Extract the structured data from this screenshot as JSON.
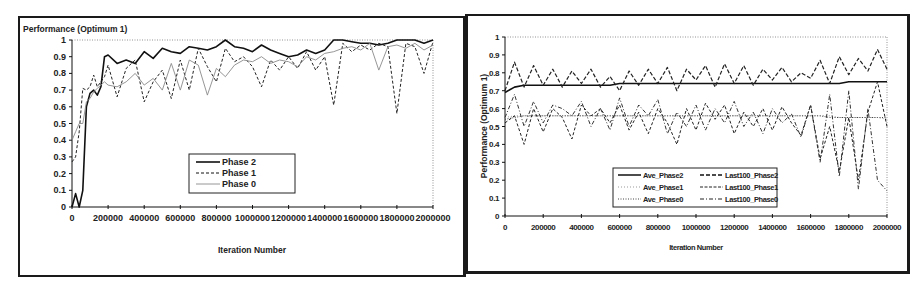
{
  "chart_data": [
    {
      "type": "line",
      "title": "Performance (Optimum 1)",
      "xlabel": "Iteration Number",
      "ylabel": "Performance (Optimum 1)",
      "xlim": [
        0,
        2000000
      ],
      "ylim": [
        0,
        1
      ],
      "x_ticks": [
        "0",
        "200000",
        "400000",
        "600000",
        "800000",
        "1000000",
        "1200000",
        "1400000",
        "1600000",
        "1800000",
        "2000000"
      ],
      "y_ticks": [
        "0",
        "0.1",
        "0.2",
        "0.3",
        "0.4",
        "0.5",
        "0.6",
        "0.7",
        "0.8",
        "0.9",
        "1"
      ],
      "grid": false,
      "legend_position": "center",
      "x": [
        0,
        20000,
        40000,
        60000,
        80000,
        100000,
        120000,
        140000,
        160000,
        180000,
        200000,
        250000,
        300000,
        350000,
        400000,
        450000,
        500000,
        550000,
        600000,
        650000,
        700000,
        750000,
        800000,
        850000,
        900000,
        950000,
        1000000,
        1050000,
        1100000,
        1150000,
        1200000,
        1250000,
        1300000,
        1350000,
        1400000,
        1450000,
        1500000,
        1550000,
        1600000,
        1650000,
        1700000,
        1750000,
        1800000,
        1850000,
        1900000,
        1950000,
        2000000
      ],
      "series": [
        {
          "name": "Phase 2",
          "style": "solid-bold",
          "values": [
            0.0,
            0.08,
            0.0,
            0.1,
            0.6,
            0.68,
            0.7,
            0.67,
            0.72,
            0.9,
            0.91,
            0.86,
            0.88,
            0.86,
            0.93,
            0.89,
            0.95,
            0.93,
            0.92,
            0.96,
            0.95,
            0.94,
            0.96,
            1.0,
            0.96,
            0.95,
            0.93,
            0.97,
            0.94,
            0.92,
            0.9,
            0.91,
            0.94,
            0.92,
            0.94,
            1.0,
            1.0,
            0.99,
            0.98,
            0.98,
            0.97,
            0.98,
            1.0,
            1.0,
            1.0,
            0.98,
            1.0
          ]
        },
        {
          "name": "Phase 1",
          "style": "dashed",
          "values": [
            0.27,
            0.3,
            0.45,
            0.71,
            0.7,
            0.72,
            0.79,
            0.72,
            0.75,
            0.78,
            0.85,
            0.66,
            0.83,
            0.88,
            0.63,
            0.75,
            0.82,
            0.65,
            0.88,
            0.7,
            0.95,
            0.84,
            0.75,
            0.95,
            0.87,
            0.9,
            0.84,
            0.72,
            0.88,
            0.82,
            0.9,
            0.83,
            0.93,
            0.82,
            0.9,
            0.61,
            0.98,
            0.93,
            0.97,
            0.94,
            0.98,
            0.96,
            0.56,
            0.98,
            0.96,
            0.8,
            0.99
          ]
        },
        {
          "name": "Phase 0",
          "style": "thin-solid-gray",
          "values": [
            0.4,
            0.45,
            0.5,
            0.5,
            0.63,
            0.65,
            0.69,
            0.71,
            0.73,
            0.75,
            0.73,
            0.72,
            0.75,
            0.8,
            0.73,
            0.77,
            0.7,
            0.86,
            0.7,
            0.88,
            0.85,
            0.67,
            0.83,
            0.78,
            0.85,
            0.88,
            0.87,
            0.9,
            0.86,
            0.88,
            0.87,
            0.84,
            0.9,
            0.88,
            0.92,
            0.93,
            0.95,
            0.96,
            0.94,
            0.98,
            0.82,
            0.96,
            0.97,
            0.95,
            0.98,
            0.94,
            0.97
          ]
        }
      ]
    },
    {
      "type": "line",
      "title": "",
      "xlabel": "Iteration Number",
      "ylabel": "Performance (Optimum 1)",
      "xlim": [
        0,
        2000000
      ],
      "ylim": [
        0,
        1
      ],
      "x_ticks": [
        "0",
        "200000",
        "400000",
        "600000",
        "800000",
        "1000000",
        "1200000",
        "1400000",
        "1600000",
        "1800000",
        "2000000"
      ],
      "y_ticks": [
        "0",
        "0.1",
        "0.2",
        "0.3",
        "0.4",
        "0.5",
        "0.6",
        "0.7",
        "0.8",
        "0.9",
        "1"
      ],
      "grid": false,
      "legend_position": "lower-center",
      "x": [
        0,
        50000,
        100000,
        150000,
        200000,
        250000,
        300000,
        350000,
        400000,
        450000,
        500000,
        550000,
        600000,
        650000,
        700000,
        750000,
        800000,
        850000,
        900000,
        950000,
        1000000,
        1050000,
        1100000,
        1150000,
        1200000,
        1250000,
        1300000,
        1350000,
        1400000,
        1450000,
        1500000,
        1550000,
        1600000,
        1650000,
        1700000,
        1750000,
        1800000,
        1850000,
        1900000,
        1950000,
        2000000
      ],
      "series": [
        {
          "name": "Ave_Phase2",
          "style": "solid-bold",
          "values": [
            0.69,
            0.72,
            0.73,
            0.73,
            0.73,
            0.73,
            0.73,
            0.73,
            0.73,
            0.73,
            0.73,
            0.73,
            0.74,
            0.74,
            0.74,
            0.74,
            0.74,
            0.74,
            0.74,
            0.74,
            0.74,
            0.74,
            0.74,
            0.74,
            0.74,
            0.74,
            0.74,
            0.74,
            0.74,
            0.74,
            0.74,
            0.74,
            0.74,
            0.74,
            0.74,
            0.74,
            0.75,
            0.75,
            0.75,
            0.75,
            0.75
          ]
        },
        {
          "name": "Ave_Phase1",
          "style": "dotted-gray",
          "values": [
            0.55,
            0.56,
            0.56,
            0.56,
            0.56,
            0.56,
            0.56,
            0.56,
            0.56,
            0.56,
            0.56,
            0.56,
            0.56,
            0.56,
            0.56,
            0.56,
            0.56,
            0.56,
            0.56,
            0.56,
            0.56,
            0.56,
            0.56,
            0.56,
            0.56,
            0.56,
            0.56,
            0.56,
            0.56,
            0.56,
            0.56,
            0.56,
            0.56,
            0.56,
            0.56,
            0.55,
            0.55,
            0.55,
            0.55,
            0.55,
            0.54
          ]
        },
        {
          "name": "Ave_Phase0",
          "style": "dotted",
          "values": [
            0.54,
            0.55,
            0.56,
            0.56,
            0.56,
            0.56,
            0.56,
            0.56,
            0.56,
            0.56,
            0.56,
            0.56,
            0.56,
            0.56,
            0.56,
            0.56,
            0.56,
            0.56,
            0.56,
            0.56,
            0.56,
            0.56,
            0.56,
            0.56,
            0.56,
            0.56,
            0.56,
            0.56,
            0.56,
            0.56,
            0.56,
            0.56,
            0.56,
            0.56,
            0.55,
            0.55,
            0.55,
            0.55,
            0.55,
            0.55,
            0.55
          ]
        },
        {
          "name": "Last100_Phase2",
          "style": "dash-bold",
          "values": [
            0.7,
            0.86,
            0.72,
            0.84,
            0.73,
            0.82,
            0.72,
            0.81,
            0.74,
            0.82,
            0.72,
            0.78,
            0.7,
            0.81,
            0.73,
            0.82,
            0.74,
            0.83,
            0.7,
            0.82,
            0.76,
            0.84,
            0.72,
            0.85,
            0.74,
            0.84,
            0.73,
            0.82,
            0.76,
            0.83,
            0.75,
            0.8,
            0.77,
            0.87,
            0.74,
            0.89,
            0.79,
            0.88,
            0.81,
            0.93,
            0.82
          ]
        },
        {
          "name": "Last100_Phase1",
          "style": "dashed",
          "values": [
            0.52,
            0.56,
            0.4,
            0.6,
            0.47,
            0.6,
            0.55,
            0.43,
            0.62,
            0.56,
            0.6,
            0.52,
            0.62,
            0.48,
            0.58,
            0.46,
            0.6,
            0.52,
            0.4,
            0.6,
            0.48,
            0.63,
            0.54,
            0.62,
            0.46,
            0.58,
            0.5,
            0.6,
            0.48,
            0.61,
            0.52,
            0.45,
            0.62,
            0.32,
            0.5,
            0.25,
            0.55,
            0.2,
            0.58,
            0.75,
            0.5
          ]
        },
        {
          "name": "Last100_Phase0",
          "style": "dash-dot",
          "values": [
            0.55,
            0.68,
            0.5,
            0.64,
            0.52,
            0.62,
            0.6,
            0.56,
            0.64,
            0.5,
            0.6,
            0.48,
            0.66,
            0.5,
            0.62,
            0.56,
            0.65,
            0.46,
            0.58,
            0.5,
            0.62,
            0.48,
            0.6,
            0.52,
            0.64,
            0.5,
            0.58,
            0.46,
            0.6,
            0.52,
            0.57,
            0.44,
            0.62,
            0.3,
            0.68,
            0.22,
            0.7,
            0.15,
            0.6,
            0.2,
            0.14
          ]
        }
      ]
    }
  ],
  "left_chart": {
    "title": "Performance (Optimum 1)",
    "xlabel": "Iteration Number",
    "y_ticks": [
      "0",
      "0.1",
      "0.2",
      "0.3",
      "0.4",
      "0.5",
      "0.6",
      "0.7",
      "0.8",
      "0.9",
      "1"
    ],
    "x_ticks": [
      "0",
      "200000",
      "400000",
      "600000",
      "800000",
      "1000000",
      "1200000",
      "1400000",
      "1600000",
      "1800000",
      "2000000"
    ],
    "legend": [
      "Phase 2",
      "Phase 1",
      "Phase 0"
    ]
  },
  "right_chart": {
    "ylabel": "Performance (Optimum 1)",
    "xlabel": "Iteration Number",
    "y_ticks": [
      "0",
      "0.1",
      "0.2",
      "0.3",
      "0.4",
      "0.5",
      "0.6",
      "0.7",
      "0.8",
      "0.9",
      "1"
    ],
    "x_ticks": [
      "0",
      "200000",
      "400000",
      "600000",
      "800000",
      "1000000",
      "1200000",
      "1400000",
      "1600000",
      "1800000",
      "2000000"
    ],
    "legend": [
      "Ave_Phase2",
      "Ave_Phase1",
      "Ave_Phase0",
      "Last100_Phase2",
      "Last100_Phase1",
      "Last100_Phase0"
    ]
  },
  "colors": {
    "ink": "#1a1a1a",
    "phase0_gray": "#8a8a8a",
    "frame": "#1a1a1a"
  }
}
